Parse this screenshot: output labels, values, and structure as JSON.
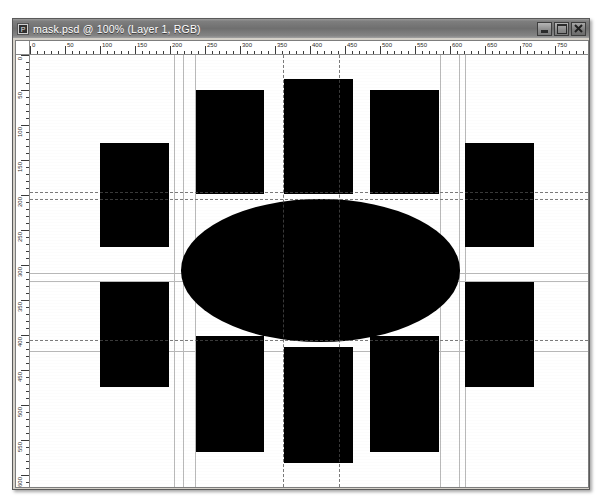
{
  "window": {
    "title": "mask.psd @ 100% (Layer 1, RGB)",
    "icon_name": "photoshop-document-icon",
    "controls": {
      "minimize_label": "Minimize",
      "maximize_label": "Maximize",
      "close_label": "Close"
    }
  },
  "rulers": {
    "unit_scale_px_per_unit": 0.7,
    "horizontal": {
      "origin_px": 0,
      "major_step": 50,
      "labels": [
        "0",
        "50",
        "100",
        "150",
        "200",
        "250",
        "300",
        "350",
        "400",
        "450",
        "500",
        "550",
        "600",
        "650",
        "700",
        "750"
      ]
    },
    "vertical": {
      "origin_px": 0,
      "major_step": 50,
      "labels": [
        "0",
        "50",
        "100",
        "150",
        "200",
        "250",
        "300",
        "350",
        "400",
        "450",
        "500",
        "550",
        "600"
      ]
    }
  },
  "canvas": {
    "background_color": "#ffffff",
    "shape_color": "#000000",
    "guide_color": "#8e8e8e",
    "guide_color_solid": "#b9b9b9",
    "ellipse": {
      "name": "center-ellipse",
      "left_pct": 27.0,
      "top_pct": 33.4,
      "width_pct": 50.0,
      "height_pct": 33.0
    },
    "rectangles": [
      {
        "name": "rect-left-upper",
        "left_pct": 12.6,
        "top_pct": 20.3,
        "width_pct": 12.3,
        "height_pct": 24.2
      },
      {
        "name": "rect-left-lower",
        "left_pct": 12.6,
        "top_pct": 52.6,
        "width_pct": 12.3,
        "height_pct": 24.2
      },
      {
        "name": "rect-midleft-top",
        "left_pct": 29.7,
        "top_pct": 8.0,
        "width_pct": 12.3,
        "height_pct": 24.2
      },
      {
        "name": "rect-midleft-bot",
        "left_pct": 29.7,
        "top_pct": 65.0,
        "width_pct": 12.3,
        "height_pct": 27.0
      },
      {
        "name": "rect-center-top",
        "left_pct": 45.5,
        "top_pct": 5.5,
        "width_pct": 12.3,
        "height_pct": 26.7
      },
      {
        "name": "rect-center-bot",
        "left_pct": 45.5,
        "top_pct": 67.5,
        "width_pct": 12.3,
        "height_pct": 27.0
      },
      {
        "name": "rect-midright-top",
        "left_pct": 61.0,
        "top_pct": 8.0,
        "width_pct": 12.3,
        "height_pct": 24.2
      },
      {
        "name": "rect-midright-bot",
        "left_pct": 61.0,
        "top_pct": 65.0,
        "width_pct": 12.3,
        "height_pct": 27.0
      },
      {
        "name": "rect-right-upper",
        "left_pct": 78.0,
        "top_pct": 20.3,
        "width_pct": 12.3,
        "height_pct": 24.2
      },
      {
        "name": "rect-right-lower",
        "left_pct": 78.0,
        "top_pct": 52.6,
        "width_pct": 12.3,
        "height_pct": 24.2
      }
    ],
    "guides_vertical": [
      {
        "name": "guide-v-1",
        "left_pct": 25.8,
        "style": "solid"
      },
      {
        "name": "guide-v-2",
        "left_pct": 27.4,
        "style": "solid"
      },
      {
        "name": "guide-v-3",
        "left_pct": 29.5,
        "style": "solid"
      },
      {
        "name": "guide-v-4",
        "left_pct": 45.3,
        "style": "dash"
      },
      {
        "name": "guide-v-5",
        "left_pct": 55.3,
        "style": "dash"
      },
      {
        "name": "guide-v-6",
        "left_pct": 73.5,
        "style": "solid"
      },
      {
        "name": "guide-v-7",
        "left_pct": 76.8,
        "style": "solid"
      },
      {
        "name": "guide-v-8",
        "left_pct": 78.0,
        "style": "solid"
      }
    ],
    "guides_horizontal": [
      {
        "name": "guide-h-1",
        "top_pct": 31.8,
        "style": "dash"
      },
      {
        "name": "guide-h-2",
        "top_pct": 33.4,
        "style": "dash"
      },
      {
        "name": "guide-h-3",
        "top_pct": 50.5,
        "style": "solid"
      },
      {
        "name": "guide-h-4",
        "top_pct": 52.3,
        "style": "solid"
      },
      {
        "name": "guide-h-5",
        "top_pct": 66.0,
        "style": "dash"
      },
      {
        "name": "guide-h-6",
        "top_pct": 68.5,
        "style": "solid"
      }
    ]
  }
}
